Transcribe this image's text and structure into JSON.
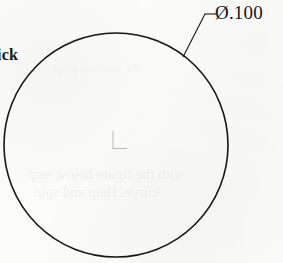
{
  "drawing": {
    "title": "Engineering drawing detail - circular hole",
    "background_color": "#fbfbfa",
    "line_color": "#161616",
    "circle": {
      "name": "hole-circle",
      "center_x": 116,
      "center_y": 145,
      "radius": 112,
      "stroke_width": 1.6
    },
    "center_mark": {
      "name": "center-mark",
      "x": 113,
      "y": 142,
      "vertical_length": 18,
      "horizontal_length": 14,
      "color": "#9a9a9a"
    },
    "leader": {
      "name": "diameter-leader-line",
      "touch_x": 183,
      "touch_y": 57,
      "elbow_x": 205,
      "elbow_y": 14,
      "end_x": 216,
      "end_y": 14
    }
  },
  "annotations": {
    "diameter_symbol": "Ø",
    "diameter_value": ".100",
    "diameter_label": "Ø.100",
    "left_clipped_label": "ick"
  },
  "bleed_through": {
    "line_1": "with the figure below step",
    "line_2": "curve. Help and spin",
    "line_3": "the scanned page"
  }
}
